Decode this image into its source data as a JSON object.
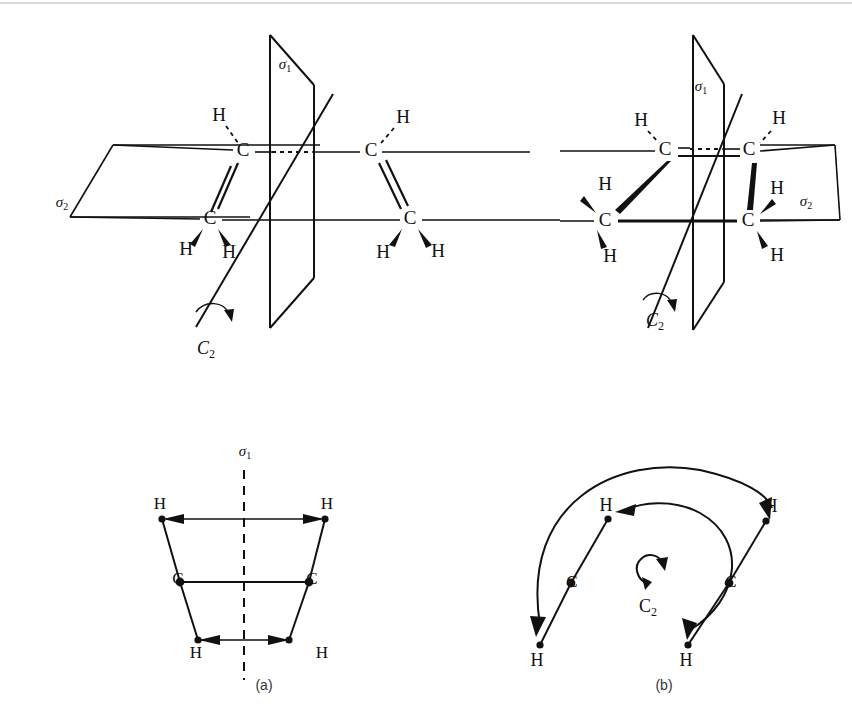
{
  "figure": {
    "top_rule_color": "#d9d9d9",
    "ink_color": "#111111",
    "background": "#ffffff"
  },
  "panels": [
    {
      "id": "top-left",
      "name": "trans-ethylene-symmetry",
      "description": "trans isomer drawn with two C=C units, mirror plane sigma-1 perpendicular, mirror plane sigma-2 in the molecular plane, and a C2 rotation axis",
      "labels": {
        "sigma1": "σ",
        "sigma1_sub": "1",
        "sigma2": "σ",
        "sigma2_sub": "2",
        "c2": "C",
        "c2_sub": "2"
      },
      "atoms": [
        {
          "element": "H",
          "x": 219,
          "y": 117
        },
        {
          "element": "C",
          "x": 243,
          "y": 152
        },
        {
          "element": "C",
          "x": 210,
          "y": 220
        },
        {
          "element": "H",
          "x": 186,
          "y": 251
        },
        {
          "element": "H",
          "x": 229,
          "y": 254
        },
        {
          "element": "C",
          "x": 371,
          "y": 152
        },
        {
          "element": "H",
          "x": 403,
          "y": 119
        },
        {
          "element": "C",
          "x": 410,
          "y": 220
        },
        {
          "element": "H",
          "x": 383,
          "y": 254
        },
        {
          "element": "H",
          "x": 438,
          "y": 253
        }
      ]
    },
    {
      "id": "top-right",
      "name": "cis-ethylene-symmetry",
      "description": "cis isomer drawn with two C=C units, mirror plane sigma-1, mirror plane sigma-2, and a C2 rotation axis",
      "labels": {
        "sigma1": "σ",
        "sigma1_sub": "1",
        "sigma2": "σ",
        "sigma2_sub": "2",
        "c2": "C",
        "c2_sub": "2"
      },
      "atoms": [
        {
          "element": "H",
          "x": 641,
          "y": 122
        },
        {
          "element": "C",
          "x": 665,
          "y": 151
        },
        {
          "element": "C",
          "x": 605,
          "y": 222
        },
        {
          "element": "H",
          "x": 605,
          "y": 186
        },
        {
          "element": "H",
          "x": 610,
          "y": 258
        },
        {
          "element": "C",
          "x": 749,
          "y": 151
        },
        {
          "element": "H",
          "x": 779,
          "y": 120
        },
        {
          "element": "C",
          "x": 748,
          "y": 222
        },
        {
          "element": "H",
          "x": 777,
          "y": 190
        },
        {
          "element": "H",
          "x": 777,
          "y": 257
        }
      ]
    },
    {
      "id": "bottom-left",
      "name": "sigma-plane-reflection-diagram",
      "caption": "(a)",
      "labels": {
        "sigma1": "σ",
        "sigma1_sub": "1"
      },
      "atoms": [
        {
          "element": "H",
          "x": 160,
          "y": 505
        },
        {
          "element": "H",
          "x": 327,
          "y": 505
        },
        {
          "element": "C",
          "x": 178,
          "y": 580
        },
        {
          "element": "C",
          "x": 312,
          "y": 580
        },
        {
          "element": "H",
          "x": 196,
          "y": 654
        },
        {
          "element": "H",
          "x": 322,
          "y": 654
        }
      ],
      "reflection_arrows": 2
    },
    {
      "id": "bottom-right",
      "name": "c2-rotation-diagram",
      "caption": "(b)",
      "labels": {
        "c2": "C",
        "c2_sub": "2"
      },
      "atoms": [
        {
          "element": "H",
          "x": 606,
          "y": 510
        },
        {
          "element": "H",
          "x": 768,
          "y": 510
        },
        {
          "element": "C",
          "x": 571,
          "y": 583
        },
        {
          "element": "C",
          "x": 729,
          "y": 583
        },
        {
          "element": "H",
          "x": 537,
          "y": 655
        },
        {
          "element": "H",
          "x": 686,
          "y": 655
        }
      ],
      "rotation_arcs": 2
    }
  ]
}
